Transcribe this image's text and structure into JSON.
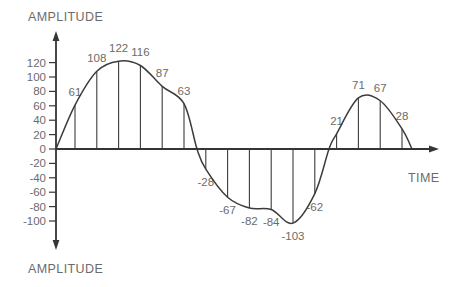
{
  "figure": {
    "y_axis_label_top": "AMPLITUDE",
    "y_axis_label_bottom": "AMPLITUDE",
    "x_axis_label": "TIME"
  },
  "chart_data": {
    "type": "line",
    "title": "",
    "xlabel": "TIME",
    "ylabel": "AMPLITUDE",
    "y_ticks": [
      120,
      100,
      80,
      60,
      40,
      20,
      0,
      -20,
      -40,
      -60,
      -80,
      -100
    ],
    "y_tick_interval": 20,
    "ylim": [
      -115,
      135
    ],
    "grid": "off",
    "legend": "none",
    "sample_values": [
      61,
      108,
      122,
      116,
      87,
      63,
      -28,
      -67,
      -82,
      -84,
      -103,
      -62,
      21,
      71,
      67,
      28
    ],
    "colors": {
      "line": "#3c3c3c",
      "axis": "#353535",
      "text": "#6b6b6b",
      "background": "#ffffff"
    }
  }
}
